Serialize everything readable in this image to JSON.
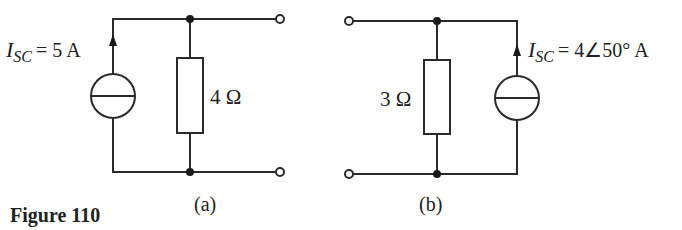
{
  "figure": {
    "caption": "Figure 110",
    "circuits": [
      {
        "id": "a",
        "sublabel": "(a)",
        "source": {
          "symbol": "I",
          "subscript": "SC",
          "value": "= 5 A"
        },
        "resistor": {
          "label": "4 Ω"
        }
      },
      {
        "id": "b",
        "sublabel": "(b)",
        "source": {
          "symbol": "I",
          "subscript": "SC",
          "value": "= 4∠50° A"
        },
        "resistor": {
          "label": "3 Ω"
        }
      }
    ]
  }
}
